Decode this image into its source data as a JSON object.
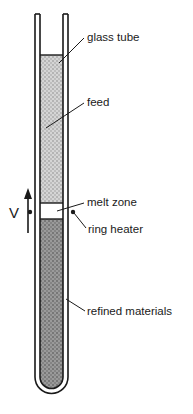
{
  "figure": {
    "width": 193,
    "height": 414,
    "background": "#ffffff",
    "ink_color": "#1a1a1a"
  },
  "labels": {
    "glass_tube": "glass tube",
    "feed": "feed",
    "melt_zone": "melt zone",
    "ring_heater": "ring heater",
    "refined_materials": "refined materials",
    "velocity": "V"
  },
  "regions": {
    "feed": {
      "name": "feed",
      "fill_color": "#c9c9c9",
      "pattern": "light-stipple",
      "top_y": 55,
      "bottom_y": 203
    },
    "melt_zone": {
      "name": "melt zone",
      "fill_color": "#ffffff",
      "pattern": "none",
      "top_y": 203,
      "bottom_y": 219
    },
    "refined_materials": {
      "name": "refined materials",
      "fill_color": "#8c8c8c",
      "pattern": "dark-stipple",
      "top_y": 219,
      "bottom_y": 393
    }
  },
  "tube": {
    "outer_left": 35,
    "outer_right": 68,
    "inner_left": 40,
    "inner_right": 63,
    "top_y": 14,
    "bottom_y": 399,
    "wall_color": "#1a1a1a",
    "shape": "open-top-round-bottom"
  },
  "heater": {
    "left_dot_x": 30,
    "right_dot_x": 73,
    "dot_y": 212,
    "dot_radius": 2.2,
    "color": "#1a1a1a"
  },
  "arrow": {
    "name": "velocity-arrow",
    "direction": "up",
    "x": 28,
    "tip_y": 190,
    "tail_y": 233,
    "color": "#1a1a1a"
  }
}
